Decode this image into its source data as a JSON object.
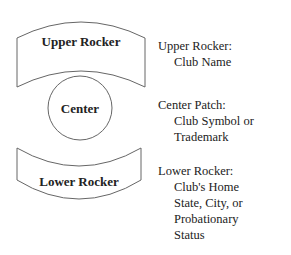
{
  "diagram": {
    "shapes": {
      "upper_rocker": {
        "label": "Upper Rocker"
      },
      "center": {
        "label": "Center"
      },
      "lower_rocker": {
        "label": "Lower Rocker"
      }
    },
    "descriptions": {
      "upper": {
        "heading": "Upper Rocker:",
        "lines": [
          "Club Name"
        ]
      },
      "center": {
        "heading": "Center Patch:",
        "lines": [
          "Club Symbol or",
          "Trademark"
        ]
      },
      "lower": {
        "heading": "Lower Rocker:",
        "lines": [
          "Club's Home",
          "State, City, or",
          "Probationary",
          "Status"
        ]
      }
    },
    "colors": {
      "stroke": "#666666",
      "text": "#222222"
    }
  }
}
